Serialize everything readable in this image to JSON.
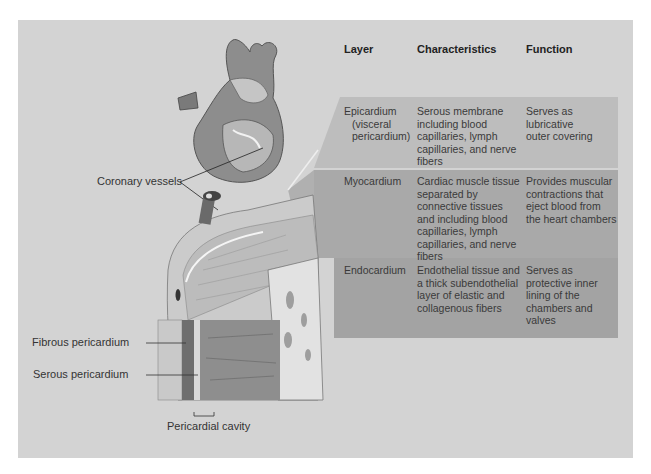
{
  "figure": {
    "labels": {
      "coronary_vessels": "Coronary vessels",
      "fibrous_pericardium": "Fibrous pericardium",
      "serous_pericardium": "Serous pericardium",
      "pericardial_cavity": "Pericardial cavity"
    },
    "colors": {
      "background": "#d3d3d3",
      "epicardium_band": "#bdbdbd",
      "myocardium_band": "#a9a9a9",
      "endocardium_band": "#a2a2a2",
      "text": "#333333"
    }
  },
  "table": {
    "headers": [
      "Layer",
      "Characteristics",
      "Function"
    ],
    "rows": [
      {
        "layer": [
          "Epicardium",
          "(visceral",
          "pericardium)"
        ],
        "characteristics": [
          "Serous membrane",
          "including blood",
          "capillaries, lymph",
          "capillaries, and nerve",
          "fibers"
        ],
        "function": [
          "Serves as",
          "lubricative",
          "outer covering"
        ]
      },
      {
        "layer": [
          "Myocardium"
        ],
        "characteristics": [
          "Cardiac muscle tissue",
          "separated by",
          "connective tissues",
          "and including blood",
          "capillaries, lymph",
          "capillaries, and nerve",
          "fibers"
        ],
        "function": [
          "Provides muscular",
          "contractions that",
          "eject blood from",
          "the heart chambers"
        ]
      },
      {
        "layer": [
          "Endocardium"
        ],
        "characteristics": [
          "Endothelial tissue and",
          "a thick subendothelial",
          "layer of elastic and",
          "collagenous fibers"
        ],
        "function": [
          "Serves as",
          "protective inner",
          "lining of the",
          "chambers and",
          "valves"
        ]
      }
    ]
  }
}
